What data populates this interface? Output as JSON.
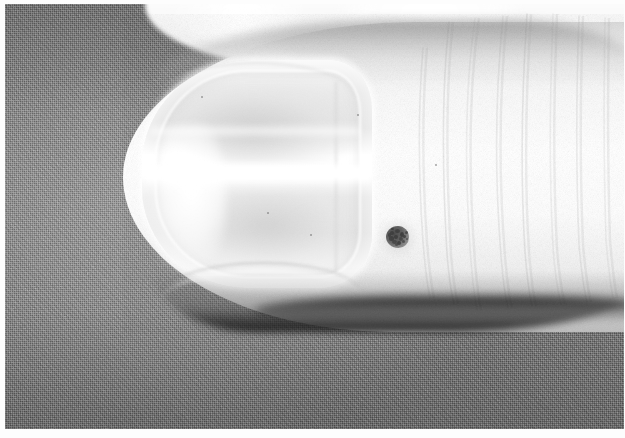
{
  "image": {
    "kind": "clinical-photograph",
    "subject": "human thumb with fingernail",
    "color_mode": "grayscale",
    "caption": "",
    "width": "625",
    "height": "438"
  },
  "frame": {
    "border_color": "#ffffff",
    "border_left_px": "5",
    "border_top_px": "4",
    "border_bottom_px": "9",
    "border_right_px": "1"
  },
  "regions": {
    "background": {
      "name": "woven gray cloth backdrop",
      "color": "#767676",
      "texture": "fine woven weave"
    },
    "background_finger": {
      "name": "second finger behind, top edge",
      "color": "#f2f2f2"
    },
    "finger": {
      "name": "thumb / fingertip",
      "color": "#f8f8f8",
      "shadow_color": "#1a1a1a"
    },
    "nail": {
      "name": "fingernail plate",
      "color": "#eaeaea",
      "highlight_color": "#ffffff",
      "nail_bed_color": "#c4c4c4"
    },
    "lesion": {
      "name": "pigmented skin lesion",
      "color": "#4a4a4a",
      "location": "periungual skin lateral to nail fold",
      "center_x": "393",
      "center_y": "234",
      "diameter_px": "23",
      "appearance": "small round speckled dark macule"
    },
    "wrinkles": {
      "name": "knuckle skin creases",
      "color": "#969696",
      "count": "7"
    }
  },
  "specks": [
    {
      "x": "262",
      "y": "208",
      "size": "2"
    },
    {
      "x": "305",
      "y": "230",
      "size": "2"
    },
    {
      "x": "352",
      "y": "110",
      "size": "2"
    },
    {
      "x": "196",
      "y": "92",
      "size": "2"
    },
    {
      "x": "430",
      "y": "160",
      "size": "2"
    }
  ],
  "lesion_specks": [
    {
      "x": "4",
      "y": "5",
      "w": "4",
      "h": "4"
    },
    {
      "x": "9",
      "y": "3",
      "w": "5",
      "h": "4"
    },
    {
      "x": "14",
      "y": "6",
      "w": "4",
      "h": "5"
    },
    {
      "x": "3",
      "y": "10",
      "w": "5",
      "h": "5"
    },
    {
      "x": "8",
      "y": "9",
      "w": "4",
      "h": "4"
    },
    {
      "x": "13",
      "y": "11",
      "w": "4",
      "h": "4"
    },
    {
      "x": "6",
      "y": "14",
      "w": "5",
      "h": "4"
    },
    {
      "x": "11",
      "y": "15",
      "w": "4",
      "h": "4"
    },
    {
      "x": "17",
      "y": "9",
      "w": "3",
      "h": "3"
    },
    {
      "x": "16",
      "y": "14",
      "w": "3",
      "h": "3"
    },
    {
      "x": "2",
      "y": "7",
      "w": "3",
      "h": "4"
    },
    {
      "x": "9",
      "y": "17",
      "w": "3",
      "h": "3"
    },
    {
      "x": "19",
      "y": "5",
      "w": "3",
      "h": "3"
    },
    {
      "x": "20",
      "y": "12",
      "w": "2",
      "h": "2"
    },
    {
      "x": "5",
      "y": "2",
      "w": "3",
      "h": "2"
    }
  ],
  "wrinkle_paths": [
    "M 470 14 C 462 70, 458 150, 466 258 C 468 282, 470 296, 472 306",
    "M 498 12 C 492 72, 488 152, 496 252 C 498 276, 500 292, 503 304",
    "M 522 10 C 518 70, 514 150, 520 248 C 522 272, 524 290, 527 302",
    "M 548 10 C 546 68, 543 146, 548 244 C 550 268, 552 286, 556 300",
    "M 574 12 C 572 66, 570 144, 574 240 C 576 264, 578 282, 582 298",
    "M 444 18 C 438 74, 436 148, 442 250 C 444 274, 446 288, 449 300",
    "M 600 14 C 599 66, 598 142, 601 236 C 603 260, 605 278, 608 294",
    "M 418 44 C 414 92, 412 152, 418 238 C 420 262, 422 280, 425 294"
  ]
}
